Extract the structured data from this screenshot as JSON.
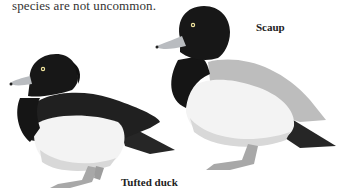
{
  "text": {
    "body_line": "species are not uncommon."
  },
  "illustrations": [
    {
      "name": "Tufted duck",
      "label": "Tufted duck"
    },
    {
      "name": "Scaup",
      "label": "Scaup"
    }
  ],
  "colors": {
    "background": "#ffffff",
    "plumage_dark": "#1b1b1b",
    "plumage_white": "#f4f4f4",
    "scaup_back": "#bdbdbd",
    "bill": "#b9bcc0",
    "legs": "#a8a8a8"
  }
}
